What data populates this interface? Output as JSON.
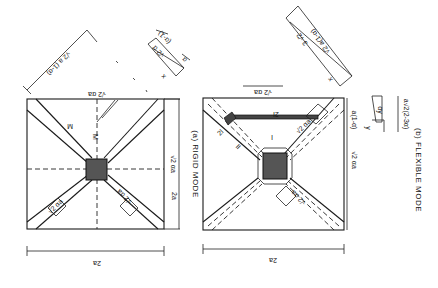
{
  "figure": {
    "orientation": "rotated 180 degrees",
    "panels": [
      {
        "id": "a",
        "caption": "(a) RIGID MODE",
        "labels": {
          "width": "2a",
          "height": "2a",
          "diag_length": "√2 a (1-α)",
          "top_dim": "√2 αa",
          "side_dim": "√2 αa",
          "band_width": "√2 αa",
          "region_a": "M",
          "region_b": "M",
          "inset_a": "(α-1)",
          "inset_b": "√2 α",
          "inset_c": "α",
          "inset_x": "x"
        }
      },
      {
        "id": "b",
        "caption": "(b) FLEXIBLE MODE",
        "labels": {
          "width": "2a",
          "top_dim": "√2 αa",
          "side_dim_a": "√2 αa",
          "side_dim_b": "a(1-α)",
          "band_width": "√2 αa",
          "region_I": "I",
          "region_II": "II",
          "edge_beam_1": "2l",
          "edge_beam_2": "2l",
          "inset_a": "√2 a(1-α)",
          "inset_b": "3 √2",
          "inset_x": "x",
          "side_inset": "a√2(2-3α)",
          "side_inset_y": "y",
          "side_inset_c": "αy"
        }
      }
    ]
  }
}
